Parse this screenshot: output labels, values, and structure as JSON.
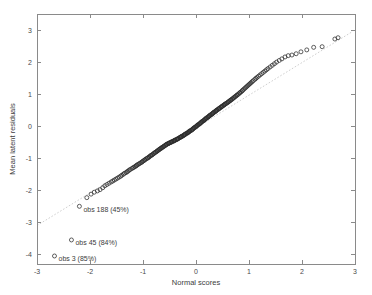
{
  "chart_data": {
    "type": "scatter",
    "title": "",
    "subtitle": "",
    "xlabel": "Normal scores",
    "ylabel": "Mean latent residuals",
    "xlim": [
      -3,
      3
    ],
    "ylim": [
      -4.3,
      3.5
    ],
    "xticks": [
      -3,
      -2,
      -1,
      0,
      1,
      2,
      3
    ],
    "xticklabels": [
      "-3",
      "-2",
      "-1",
      "0",
      "1",
      "2",
      "3"
    ],
    "yticks": [
      3,
      2,
      1,
      0,
      -1,
      -2,
      -3,
      -4
    ],
    "yticklabels": [
      "3",
      "2",
      "1",
      "0",
      "-1",
      "-2",
      "-3",
      "-4"
    ],
    "grid": false,
    "legend": null,
    "marker": "open-circle",
    "marker_color": "#2b2b2b",
    "reference_line": {
      "style": "dotted",
      "color": "#c9c9c9",
      "x": [
        -3.0,
        2.95
      ],
      "y": [
        -3.1,
        2.95
      ]
    },
    "annotations": [
      {
        "label": "obs 188 (45%)",
        "x": -2.2,
        "y": -2.5
      },
      {
        "label": "obs 45 (84%)",
        "x": -2.35,
        "y": -3.55
      },
      {
        "label": "obs 3 (85%)",
        "x": -2.67,
        "y": -4.05
      }
    ],
    "series": [
      {
        "name": "latent residual quantiles",
        "x": [
          -2.67,
          -2.35,
          -2.2,
          -2.06,
          -1.98,
          -1.92,
          -1.86,
          -1.81,
          -1.76,
          -1.72,
          -1.68,
          -1.64,
          -1.6,
          -1.57,
          -1.54,
          -1.51,
          -1.48,
          -1.45,
          -1.42,
          -1.4,
          -1.37,
          -1.35,
          -1.32,
          -1.3,
          -1.28,
          -1.26,
          -1.24,
          -1.21,
          -1.19,
          -1.17,
          -1.15,
          -1.13,
          -1.12,
          -1.1,
          -1.08,
          -1.06,
          -1.04,
          -1.02,
          -1.01,
          -0.99,
          -0.97,
          -0.96,
          -0.94,
          -0.92,
          -0.91,
          -0.89,
          -0.88,
          -0.86,
          -0.85,
          -0.83,
          -0.82,
          -0.8,
          -0.79,
          -0.77,
          -0.76,
          -0.74,
          -0.73,
          -0.72,
          -0.7,
          -0.69,
          -0.68,
          -0.66,
          -0.65,
          -0.64,
          -0.62,
          -0.61,
          -0.6,
          -0.58,
          -0.57,
          -0.56,
          -0.55,
          -0.53,
          -0.52,
          -0.51,
          -0.5,
          -0.48,
          -0.47,
          -0.46,
          -0.45,
          -0.43,
          -0.42,
          -0.41,
          -0.4,
          -0.39,
          -0.37,
          -0.36,
          -0.35,
          -0.34,
          -0.33,
          -0.31,
          -0.3,
          -0.29,
          -0.28,
          -0.27,
          -0.26,
          -0.24,
          -0.23,
          -0.22,
          -0.21,
          -0.2,
          -0.19,
          -0.17,
          -0.16,
          -0.15,
          -0.14,
          -0.13,
          -0.12,
          -0.11,
          -0.09,
          -0.08,
          -0.07,
          -0.06,
          -0.05,
          -0.04,
          -0.03,
          -0.01,
          0.0,
          0.01,
          0.02,
          0.03,
          0.04,
          0.06,
          0.07,
          0.08,
          0.09,
          0.1,
          0.11,
          0.12,
          0.14,
          0.15,
          0.16,
          0.17,
          0.18,
          0.19,
          0.2,
          0.22,
          0.23,
          0.24,
          0.25,
          0.26,
          0.27,
          0.29,
          0.3,
          0.31,
          0.32,
          0.33,
          0.34,
          0.36,
          0.37,
          0.38,
          0.39,
          0.4,
          0.42,
          0.43,
          0.44,
          0.45,
          0.47,
          0.48,
          0.49,
          0.5,
          0.52,
          0.53,
          0.54,
          0.55,
          0.57,
          0.58,
          0.6,
          0.61,
          0.62,
          0.64,
          0.65,
          0.66,
          0.68,
          0.69,
          0.71,
          0.72,
          0.74,
          0.75,
          0.77,
          0.78,
          0.8,
          0.82,
          0.83,
          0.85,
          0.87,
          0.88,
          0.9,
          0.92,
          0.94,
          0.96,
          0.98,
          1.0,
          1.02,
          1.04,
          1.06,
          1.08,
          1.11,
          1.13,
          1.15,
          1.18,
          1.21,
          1.24,
          1.27,
          1.3,
          1.33,
          1.36,
          1.4,
          1.44,
          1.48,
          1.52,
          1.57,
          1.62,
          1.68,
          1.74,
          1.81,
          1.89,
          1.98,
          2.09,
          2.22,
          2.38,
          2.62,
          2.68
        ],
        "y": [
          -4.05,
          -3.55,
          -2.5,
          -2.23,
          -2.12,
          -2.06,
          -2.02,
          -1.98,
          -1.92,
          -1.86,
          -1.82,
          -1.78,
          -1.74,
          -1.71,
          -1.68,
          -1.65,
          -1.62,
          -1.59,
          -1.56,
          -1.53,
          -1.5,
          -1.47,
          -1.45,
          -1.42,
          -1.4,
          -1.37,
          -1.35,
          -1.32,
          -1.3,
          -1.28,
          -1.26,
          -1.24,
          -1.22,
          -1.2,
          -1.18,
          -1.16,
          -1.14,
          -1.12,
          -1.1,
          -1.08,
          -1.06,
          -1.04,
          -1.02,
          -1.0,
          -0.99,
          -0.97,
          -0.95,
          -0.93,
          -0.91,
          -0.9,
          -0.88,
          -0.86,
          -0.84,
          -0.82,
          -0.81,
          -0.79,
          -0.77,
          -0.76,
          -0.74,
          -0.72,
          -0.71,
          -0.69,
          -0.68,
          -0.66,
          -0.65,
          -0.63,
          -0.62,
          -0.6,
          -0.59,
          -0.57,
          -0.56,
          -0.55,
          -0.54,
          -0.53,
          -0.52,
          -0.51,
          -0.5,
          -0.49,
          -0.48,
          -0.47,
          -0.46,
          -0.45,
          -0.44,
          -0.43,
          -0.42,
          -0.41,
          -0.4,
          -0.39,
          -0.38,
          -0.36,
          -0.35,
          -0.34,
          -0.33,
          -0.32,
          -0.31,
          -0.3,
          -0.28,
          -0.27,
          -0.26,
          -0.25,
          -0.23,
          -0.22,
          -0.21,
          -0.2,
          -0.18,
          -0.17,
          -0.16,
          -0.14,
          -0.13,
          -0.12,
          -0.1,
          -0.09,
          -0.07,
          -0.06,
          -0.04,
          -0.03,
          -0.01,
          0.0,
          0.02,
          0.03,
          0.05,
          0.06,
          0.08,
          0.09,
          0.11,
          0.12,
          0.14,
          0.15,
          0.17,
          0.18,
          0.2,
          0.21,
          0.23,
          0.24,
          0.26,
          0.27,
          0.29,
          0.3,
          0.32,
          0.33,
          0.35,
          0.36,
          0.38,
          0.39,
          0.41,
          0.42,
          0.44,
          0.45,
          0.47,
          0.48,
          0.5,
          0.51,
          0.53,
          0.54,
          0.56,
          0.57,
          0.59,
          0.6,
          0.62,
          0.63,
          0.65,
          0.66,
          0.68,
          0.69,
          0.71,
          0.72,
          0.74,
          0.76,
          0.77,
          0.79,
          0.81,
          0.82,
          0.84,
          0.86,
          0.88,
          0.9,
          0.92,
          0.94,
          0.96,
          0.98,
          1.0,
          1.03,
          1.05,
          1.07,
          1.1,
          1.12,
          1.15,
          1.18,
          1.21,
          1.24,
          1.27,
          1.3,
          1.33,
          1.36,
          1.39,
          1.42,
          1.46,
          1.49,
          1.52,
          1.56,
          1.6,
          1.64,
          1.68,
          1.72,
          1.76,
          1.8,
          1.85,
          1.9,
          1.95,
          2.0,
          2.05,
          2.1,
          2.16,
          2.2,
          2.22,
          2.26,
          2.32,
          2.38,
          2.46,
          2.48,
          2.72,
          2.76
        ]
      }
    ]
  }
}
